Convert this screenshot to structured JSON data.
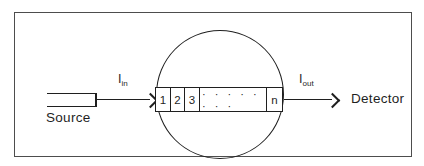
{
  "diagram": {
    "source_label": "Source",
    "detector_label": "Detector",
    "input_intensity": {
      "symbol": "I",
      "subscript": "in"
    },
    "output_intensity": {
      "symbol": "I",
      "subscript": "out"
    },
    "segments": [
      "1",
      "2",
      "3"
    ],
    "segment_dots": "· · · · · · · ·",
    "segment_last": "n"
  },
  "colors": {
    "line": "#1f1f1f",
    "frame_border": "#4d4d4d",
    "background": "#ffffff"
  }
}
